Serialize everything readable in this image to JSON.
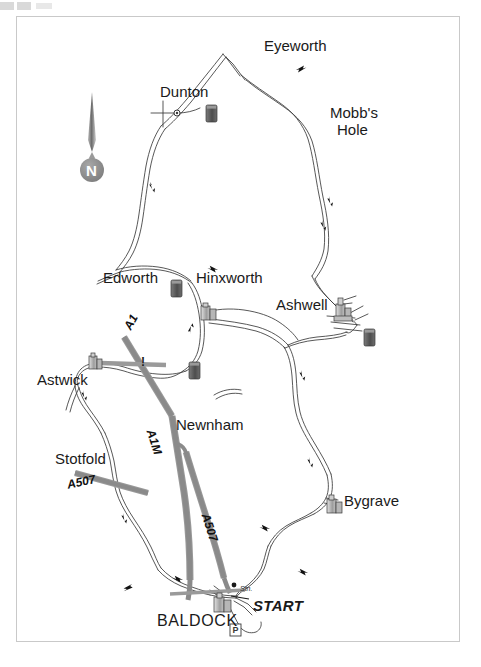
{
  "map": {
    "title_region": "Baldock cycle route map",
    "frame_color": "#c9c9c9",
    "background": "#ffffff",
    "ink_color": "#1a1a1a",
    "trunk_road_color": "#8c8c8c",
    "symbol_color": "#5a5a5a",
    "compass": {
      "label": "N",
      "name": "compass-rose",
      "badge_color": "#8a8a8a"
    },
    "places": [
      {
        "name": "eyeworth",
        "label": "Eyeworth",
        "x": 264,
        "y": 47,
        "align": "left"
      },
      {
        "name": "dunton",
        "label": "Dunton",
        "x": 160,
        "y": 86,
        "align": "left"
      },
      {
        "name": "mobbs-hole",
        "label": "Mobb's",
        "x": 330,
        "y": 107,
        "align": "left"
      },
      {
        "name": "mobbs-hole-2",
        "label": "Hole",
        "x": 336,
        "y": 124,
        "align": "left"
      },
      {
        "name": "edworth",
        "label": "Edworth",
        "x": 103,
        "y": 272,
        "align": "left"
      },
      {
        "name": "hinxworth",
        "label": "Hinxworth",
        "x": 195,
        "y": 272,
        "align": "left"
      },
      {
        "name": "ashwell",
        "label": "Ashwell",
        "x": 276,
        "y": 299,
        "align": "left"
      },
      {
        "name": "astwick",
        "label": "Astwick",
        "x": 37,
        "y": 374,
        "align": "left"
      },
      {
        "name": "newnham",
        "label": "Newnham",
        "x": 176,
        "y": 419,
        "align": "left"
      },
      {
        "name": "stotfold",
        "label": "Stotfold",
        "x": 55,
        "y": 453,
        "align": "left"
      },
      {
        "name": "bygrave",
        "label": "Bygrave",
        "x": 344,
        "y": 495,
        "align": "left"
      },
      {
        "name": "baldock",
        "label": "BALDOCK",
        "x": 157,
        "y": 614,
        "align": "left"
      }
    ],
    "road_labels": [
      {
        "name": "a1-label",
        "label": "A1",
        "x": 124,
        "y": 329,
        "rotate": -62
      },
      {
        "name": "a1m-label",
        "label": "A1M",
        "x": 158,
        "y": 432,
        "rotate": 72
      },
      {
        "name": "a507-label",
        "label": "A507",
        "x": 68,
        "y": 482,
        "rotate": -12
      },
      {
        "name": "a507-label-2",
        "label": "A507",
        "x": 213,
        "y": 515,
        "rotate": 72
      }
    ],
    "annotations": [
      {
        "name": "start-marker",
        "label": "START",
        "x": 253,
        "y": 600
      },
      {
        "name": "station-label",
        "label": "Stn.",
        "x": 241,
        "y": 588
      }
    ],
    "symbols": [
      {
        "name": "pub-symbol",
        "kind": "tankard",
        "x": 211,
        "y": 113
      },
      {
        "name": "pub-symbol",
        "kind": "tankard",
        "x": 176,
        "y": 288
      },
      {
        "name": "pub-symbol",
        "kind": "tankard",
        "x": 194,
        "y": 370
      },
      {
        "name": "pub-symbol",
        "kind": "tankard",
        "x": 369,
        "y": 337
      },
      {
        "name": "church-symbol",
        "kind": "church",
        "x": 207,
        "y": 311
      },
      {
        "name": "church-symbol",
        "kind": "church",
        "x": 95,
        "y": 361
      },
      {
        "name": "church-symbol",
        "kind": "church",
        "x": 340,
        "y": 310
      },
      {
        "name": "church-symbol",
        "kind": "church",
        "x": 333,
        "y": 503
      },
      {
        "name": "church-symbol",
        "kind": "church",
        "x": 222,
        "y": 602
      },
      {
        "name": "parking-symbol",
        "kind": "parking",
        "x": 235,
        "y": 630
      }
    ]
  }
}
